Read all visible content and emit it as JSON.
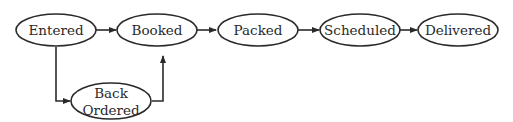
{
  "diagram": {
    "type": "flowchart",
    "nodes": [
      {
        "id": "entered",
        "label": "Entered"
      },
      {
        "id": "booked",
        "label": "Booked"
      },
      {
        "id": "packed",
        "label": "Packed"
      },
      {
        "id": "scheduled",
        "label": "Scheduled"
      },
      {
        "id": "delivered",
        "label": "Delivered"
      },
      {
        "id": "back_ordered",
        "label_line1": "Back",
        "label_line2": "Ordered"
      }
    ],
    "edges": [
      {
        "from": "entered",
        "to": "booked"
      },
      {
        "from": "booked",
        "to": "packed"
      },
      {
        "from": "packed",
        "to": "scheduled"
      },
      {
        "from": "scheduled",
        "to": "delivered"
      },
      {
        "from": "entered",
        "to": "back_ordered"
      },
      {
        "from": "back_ordered",
        "to": "booked"
      }
    ],
    "colors": {
      "stroke": "#2a2a2a",
      "background": "#ffffff"
    }
  }
}
